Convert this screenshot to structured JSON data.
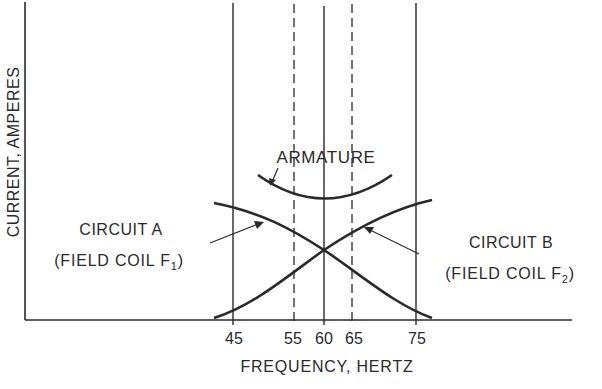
{
  "figure": {
    "y_axis_label": "CURRENT, AMPERES",
    "x_axis_label": "FREQUENCY, HERTZ",
    "x_ticks": [
      {
        "label": "45",
        "style": "solid"
      },
      {
        "label": "55",
        "style": "dashed"
      },
      {
        "label": "60",
        "style": "solid"
      },
      {
        "label": "65",
        "style": "dashed"
      },
      {
        "label": "75",
        "style": "solid"
      }
    ],
    "curves": {
      "armature": {
        "label": "ARMATURE"
      },
      "circuit_a": {
        "label_line1": "CIRCUIT A",
        "label_line2_prefix": "(FIELD COIL F",
        "label_line2_sub": "1",
        "label_line2_suffix": ")"
      },
      "circuit_b": {
        "label_line1": "CIRCUIT B",
        "label_line2_prefix": "(FIELD COIL F",
        "label_line2_sub": "2",
        "label_line2_suffix": ")"
      }
    },
    "line_color": "#2a2a2a"
  }
}
